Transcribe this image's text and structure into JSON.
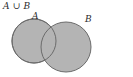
{
  "figure": {
    "caption": "A ∪ B",
    "background_color": "#ffffff",
    "fill_color": "#b4b4b4",
    "stroke_color": "#6b6b6b",
    "text_color": "#2b2b2b",
    "sets": [
      {
        "id": "set-a",
        "label": "A",
        "cx": 34,
        "cy": 41,
        "r": 22
      },
      {
        "id": "set-b",
        "label": "B",
        "cx": 66,
        "cy": 47,
        "r": 25
      }
    ],
    "shading": {
      "region": "union",
      "description": "both circles shaded including intersection"
    }
  }
}
